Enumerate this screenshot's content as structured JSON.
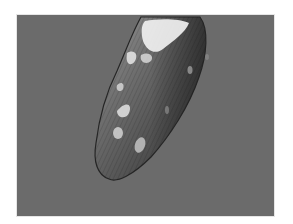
{
  "image": {
    "subject": "grayscale photo of an elongated vegetable (pepper) with water droplets",
    "alt": "Grayscale photograph of a glossy elongated pepper with water droplets on a gray background",
    "colors": {
      "page_background": "#ffffff",
      "photo_background": "#6b6b6b",
      "object_dark": "#2e2e2e",
      "object_mid": "#5a5a5a",
      "highlight": "#f2f2f2"
    }
  }
}
